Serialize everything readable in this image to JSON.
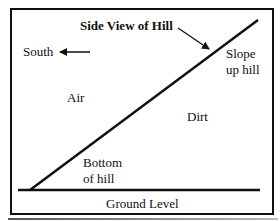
{
  "diagram": {
    "title": "Side View of Hill",
    "labels": {
      "south": "South",
      "air": "Air",
      "dirt": "Dirt",
      "slope": [
        "Slope",
        "up hill"
      ],
      "bottom": [
        "Bottom",
        "of hill"
      ],
      "ground": "Ground Level"
    },
    "colors": {
      "line": "#111111",
      "background": "#ffffff"
    }
  }
}
